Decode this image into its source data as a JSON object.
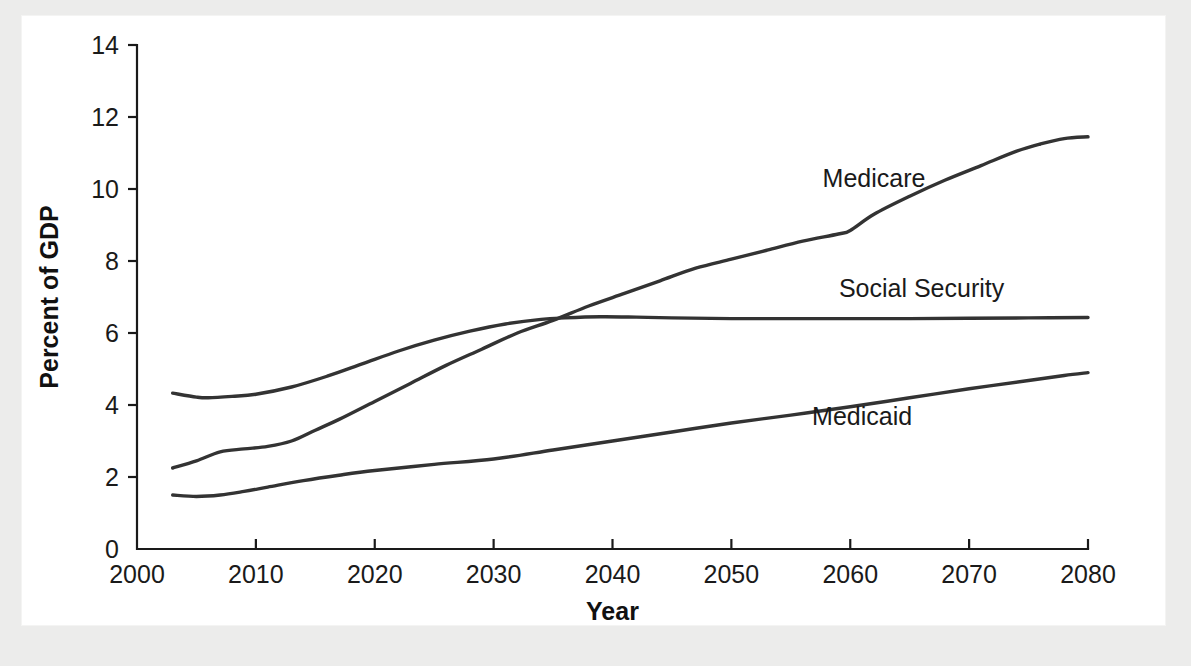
{
  "chart_data": {
    "type": "line",
    "title": "",
    "xlabel": "Year",
    "ylabel": "Percent of GDP",
    "xlim": [
      2000,
      2080
    ],
    "ylim": [
      0,
      14
    ],
    "xticks": [
      2000,
      2010,
      2020,
      2030,
      2040,
      2050,
      2060,
      2070,
      2080
    ],
    "xticklabels": [
      "2000",
      "2010",
      "2020",
      "2030",
      "2040",
      "2050",
      "2060",
      "2070",
      "2080"
    ],
    "yticks": [
      0,
      2,
      4,
      6,
      8,
      10,
      12,
      14
    ],
    "yticklabels": [
      "0",
      "2",
      "4",
      "6",
      "8",
      "10",
      "12",
      "14"
    ],
    "grid": false,
    "legend_position": "inline-annotations",
    "line_color": "#333333",
    "series": [
      {
        "name": "Medicare",
        "label_x": 2062,
        "label_y": 10.05,
        "x": [
          2003,
          2005,
          2007,
          2009,
          2011,
          2013,
          2015,
          2017,
          2020,
          2023,
          2026,
          2029,
          2032,
          2035,
          2038,
          2041,
          2044,
          2047,
          2050,
          2053,
          2056,
          2059,
          2060,
          2062,
          2065,
          2068,
          2071,
          2074,
          2076,
          2078,
          2080
        ],
        "values": [
          2.25,
          2.45,
          2.7,
          2.78,
          2.85,
          3.0,
          3.3,
          3.6,
          4.1,
          4.6,
          5.1,
          5.55,
          6.0,
          6.35,
          6.75,
          7.1,
          7.45,
          7.8,
          8.05,
          8.3,
          8.55,
          8.75,
          8.85,
          9.3,
          9.8,
          10.25,
          10.65,
          11.05,
          11.25,
          11.4,
          11.45
        ]
      },
      {
        "name": "Social Security",
        "label_x": 2066,
        "label_y": 7.0,
        "x": [
          2003,
          2005,
          2006,
          2008,
          2010,
          2013,
          2016,
          2019,
          2022,
          2025,
          2028,
          2031,
          2034,
          2036,
          2039,
          2042,
          2045,
          2050,
          2055,
          2060,
          2065,
          2070,
          2075,
          2080
        ],
        "values": [
          4.33,
          4.22,
          4.2,
          4.24,
          4.3,
          4.5,
          4.8,
          5.15,
          5.5,
          5.8,
          6.05,
          6.25,
          6.38,
          6.42,
          6.45,
          6.44,
          6.42,
          6.4,
          6.4,
          6.4,
          6.4,
          6.41,
          6.42,
          6.43
        ]
      },
      {
        "name": "Medicaid",
        "label_x": 2061,
        "label_y": 3.45,
        "x": [
          2003,
          2005,
          2007,
          2009,
          2011,
          2014,
          2017,
          2020,
          2025,
          2030,
          2035,
          2040,
          2045,
          2050,
          2055,
          2060,
          2065,
          2070,
          2075,
          2078,
          2080
        ],
        "values": [
          1.5,
          1.46,
          1.5,
          1.6,
          1.72,
          1.9,
          2.05,
          2.18,
          2.35,
          2.5,
          2.75,
          3.0,
          3.25,
          3.5,
          3.72,
          3.95,
          4.2,
          4.45,
          4.68,
          4.82,
          4.9
        ]
      }
    ]
  }
}
